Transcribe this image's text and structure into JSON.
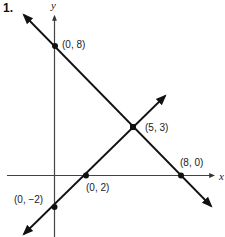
{
  "problem_number": "1.",
  "axes": {
    "x_label": "x",
    "y_label": "y",
    "colors": {
      "axis": "#444444",
      "line": "#111111",
      "point": "#111111"
    }
  },
  "lines": [
    {
      "name": "decreasing-line",
      "through": [
        "(0, 8)",
        "(5, 3)",
        "(8, 0)"
      ]
    },
    {
      "name": "increasing-line",
      "through": [
        "(0, −2)",
        "(0, 2)",
        "(5, 3)"
      ]
    }
  ],
  "points": [
    {
      "id": "p08",
      "label": "(0, 8)"
    },
    {
      "id": "p53",
      "label": "(5, 3)"
    },
    {
      "id": "p80",
      "label": "(8, 0)"
    },
    {
      "id": "p02",
      "label": "(0, 2)"
    },
    {
      "id": "p0m2",
      "label": "(0, −2)"
    }
  ]
}
